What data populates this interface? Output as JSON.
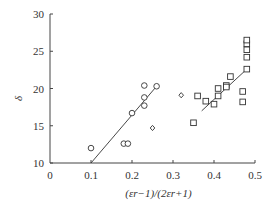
{
  "chart_data": {
    "type": "scatter",
    "title": "",
    "xlabel": "(εr−1)/(2εr+1)",
    "ylabel": "δ",
    "xlim": [
      0,
      0.5
    ],
    "ylim": [
      10,
      30
    ],
    "xticks": [
      0,
      0.1,
      0.2,
      0.3,
      0.4,
      0.5
    ],
    "xtick_labels": [
      "0",
      "0.1",
      "0.2",
      "0.3",
      "0.4",
      "0.5"
    ],
    "yticks": [
      10,
      15,
      20,
      25,
      30
    ],
    "ytick_labels": [
      "10",
      "15",
      "20",
      "25",
      "30"
    ],
    "grid": false,
    "legend": null,
    "series": [
      {
        "name": "circles",
        "marker": "circle",
        "points": [
          [
            0.1,
            12.0
          ],
          [
            0.18,
            12.6
          ],
          [
            0.19,
            12.6
          ],
          [
            0.2,
            16.7
          ],
          [
            0.23,
            20.4
          ],
          [
            0.23,
            18.8
          ],
          [
            0.23,
            17.7
          ],
          [
            0.26,
            20.3
          ]
        ]
      },
      {
        "name": "diamonds",
        "marker": "diamond",
        "points": [
          [
            0.25,
            14.7
          ],
          [
            0.32,
            19.1
          ]
        ]
      },
      {
        "name": "squares",
        "marker": "square",
        "points": [
          [
            0.35,
            15.4
          ],
          [
            0.36,
            19.0
          ],
          [
            0.38,
            18.3
          ],
          [
            0.4,
            17.9
          ],
          [
            0.41,
            20.0
          ],
          [
            0.41,
            19.0
          ],
          [
            0.43,
            20.4
          ],
          [
            0.43,
            20.2
          ],
          [
            0.44,
            21.6
          ],
          [
            0.47,
            19.6
          ],
          [
            0.47,
            18.2
          ],
          [
            0.48,
            22.6
          ],
          [
            0.48,
            24.2
          ],
          [
            0.48,
            25.2
          ],
          [
            0.48,
            26.0
          ],
          [
            0.48,
            26.5
          ]
        ]
      }
    ],
    "fit_lines": [
      {
        "name": "circle-fit",
        "from": [
          0.1,
          10.0
        ],
        "to": [
          0.26,
          20.3
        ]
      },
      {
        "name": "square-fit",
        "from": [
          0.37,
          17.0
        ],
        "to": [
          0.48,
          22.6
        ]
      }
    ]
  }
}
